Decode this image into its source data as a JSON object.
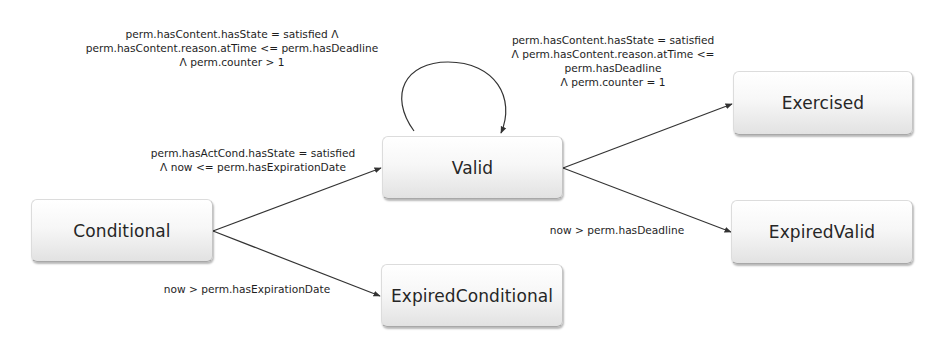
{
  "diagram": {
    "type": "state-transition",
    "states": {
      "conditional": {
        "label": "Conditional"
      },
      "valid": {
        "label": "Valid"
      },
      "expired_conditional": {
        "label": "ExpiredConditional"
      },
      "exercised": {
        "label": "Exercised"
      },
      "expired_valid": {
        "label": "ExpiredValid"
      }
    },
    "transitions": {
      "conditional_to_valid": {
        "from": "Conditional",
        "to": "Valid",
        "lines": [
          "perm.hasActCond.hasState = satisfied",
          "Λ now <= perm.hasExpirationDate"
        ]
      },
      "conditional_to_expired_conditional": {
        "from": "Conditional",
        "to": "ExpiredConditional",
        "lines": [
          "now > perm.hasExpirationDate"
        ]
      },
      "valid_self_loop": {
        "from": "Valid",
        "to": "Valid",
        "lines": [
          "perm.hasContent.hasState = satisfied Λ",
          "perm.hasContent.reason.atTime <= perm.hasDeadline",
          "Λ perm.counter > 1"
        ]
      },
      "valid_to_exercised": {
        "from": "Valid",
        "to": "Exercised",
        "lines": [
          "perm.hasContent.hasState = satisfied",
          "Λ perm.hasContent.reason.atTime <=",
          "perm.hasDeadline",
          "Λ perm.counter = 1"
        ]
      },
      "valid_to_expired_valid": {
        "from": "Valid",
        "to": "ExpiredValid",
        "lines": [
          "now > perm.hasDeadline"
        ]
      }
    },
    "colors": {
      "edge": "#333333",
      "text": "#222222",
      "box_top": "#ffffff",
      "box_bottom": "#e2e2e2"
    }
  }
}
